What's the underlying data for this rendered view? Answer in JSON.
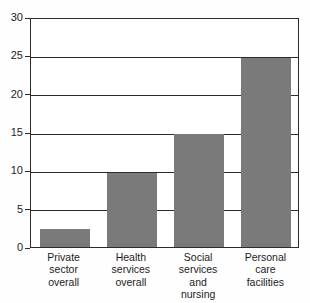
{
  "chart_data": {
    "type": "bar",
    "title": "",
    "subtitle": "",
    "xlabel": "",
    "ylabel": "",
    "ylim": [
      0,
      30
    ],
    "yticks": [
      0,
      5,
      10,
      15,
      20,
      25,
      30
    ],
    "grid": true,
    "legend": false,
    "legend_position": "none",
    "bar_color": "#7a7a7a",
    "axis_color": "#2c2c2c",
    "background_color": "#ffffff",
    "categories": [
      "Private sector overall",
      "Health services overall",
      "Social services and nursing",
      "Personal care facilities"
    ],
    "category_lines": [
      [
        "Private",
        "sector",
        "overall"
      ],
      [
        "Health",
        "services",
        "overall"
      ],
      [
        "Social",
        "services",
        "and",
        "nursing"
      ],
      [
        "Personal",
        "care",
        "facilities"
      ]
    ],
    "values": [
      2.3,
      9.7,
      14.7,
      24.6
    ],
    "annotations": []
  }
}
